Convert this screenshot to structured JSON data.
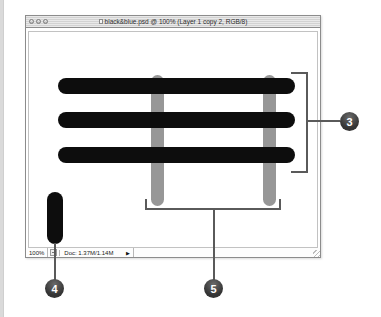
{
  "window": {
    "title": "black&blue.psd @ 100% (Layer 1 copy 2, RGB/8)",
    "titlebar_buttons": [
      {
        "name": "close"
      },
      {
        "name": "minimize"
      },
      {
        "name": "zoom"
      }
    ]
  },
  "status_bar": {
    "zoom_level": "100%",
    "doc_info": "Doc: 1.37M/1.14M",
    "popup_arrow": "▶"
  },
  "canvas_art": {
    "horizontal_black_bars": {
      "count": 3,
      "color": "#0d0d0d"
    },
    "vertical_gray_bars": {
      "count": 2,
      "color": "#979797"
    },
    "small_black_capsule": {
      "color": "#0d0d0d"
    }
  },
  "callouts": {
    "right": {
      "number": "3"
    },
    "bottom_left": {
      "number": "4"
    },
    "bottom_center": {
      "number": "5"
    }
  },
  "colors": {
    "annotation_line": "#5a5a5a",
    "callout_circle": "#3c3c3c",
    "callout_text": "#ffffff",
    "titlebar": "#d9d9d9",
    "window_border": "#8c8c8c"
  }
}
